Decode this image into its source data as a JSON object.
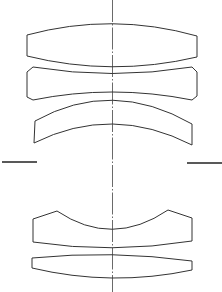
{
  "diagram": {
    "type": "optical-lens-cross-section",
    "background": "#ffffff",
    "line_color": "#333333",
    "optical_axis": {
      "x": 112.5,
      "y1": 0,
      "y2": 292
    },
    "aperture_stop": {
      "left": {
        "x1": 2,
        "x2": 37,
        "y": 162
      },
      "right": {
        "x1": 187,
        "x2": 222,
        "y": 163
      }
    },
    "elements": [
      {
        "id": "lens-1",
        "kind": "biconvex",
        "path": "M27,35 Q112,12 197,36 L197,57 Q112,77 27,56 Z"
      },
      {
        "id": "lens-2",
        "kind": "biconcave-chamfered",
        "path": "M33,67 Q112,80 192,67 L197,72 L197,96 L192,100 Q112,84 33,100 L27,97 L27,72 Z"
      },
      {
        "id": "lens-3",
        "kind": "meniscus",
        "path": "M35,121 Q112,78 192,124 L192,145 Q112,104 34,143 Z"
      },
      {
        "id": "lens-4",
        "kind": "concave-top-flat-bottom",
        "path": "M33,219 L57,211 Q112,248 168,210 L192,218 L192,241 Q112,254 33,242 Z"
      },
      {
        "id": "lens-5",
        "kind": "biconvex-thin",
        "path": "M32,258 Q112,250 192,261 L192,270 Q112,287 32,268 Z"
      }
    ]
  }
}
